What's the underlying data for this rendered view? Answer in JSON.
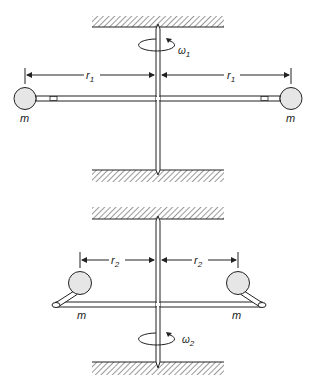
{
  "diagram": {
    "type": "rotating-shaft-two-masses",
    "colors": {
      "line": "#222222",
      "ball_fill": "#e6e6e6",
      "hatch": "#555555",
      "background": "#ffffff"
    },
    "top": {
      "mass_left": "m",
      "mass_right": "m",
      "radius_left": {
        "symbol": "r",
        "subscript": "1"
      },
      "radius_right": {
        "symbol": "r",
        "subscript": "1"
      },
      "angular_velocity": {
        "symbol": "ω",
        "subscript": "1"
      }
    },
    "bottom": {
      "mass_left": "m",
      "mass_right": "m",
      "radius_left": {
        "symbol": "r",
        "subscript": "2"
      },
      "radius_right": {
        "symbol": "r",
        "subscript": "2"
      },
      "angular_velocity": {
        "symbol": "ω",
        "subscript": "2"
      }
    }
  }
}
